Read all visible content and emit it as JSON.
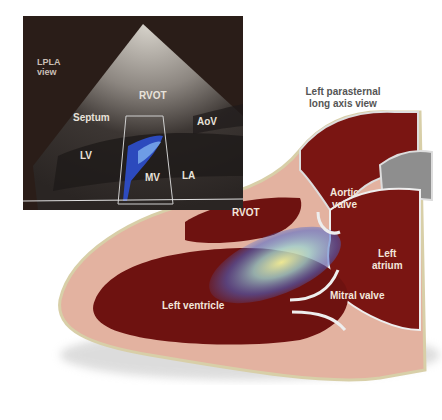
{
  "figure": {
    "title_line1": "Left parasternal",
    "title_line2": "long axis view"
  },
  "echo_panel": {
    "view_label_line1": "LPLA",
    "view_label_line2": "view",
    "labels": {
      "rvot": "RVOT",
      "septum": "Septum",
      "aov": "AoV",
      "lv": "LV",
      "mv": "MV",
      "la": "LA"
    }
  },
  "illustration": {
    "labels": {
      "rvot": "RVOT",
      "aortic_valve_line1": "Aortic",
      "aortic_valve_line2": "valve",
      "left_atrium_line1": "Left",
      "left_atrium_line2": "atrium",
      "mitral_valve": "Mitral valve",
      "left_ventricle": "Left ventricle"
    }
  },
  "colors": {
    "echo_bg": "#2a1d18",
    "blood": "#7a1512",
    "myocardium": "#e3b2a0",
    "doppler_blue": "#3a5bd8",
    "doppler_yellow": "#f4f29a"
  }
}
